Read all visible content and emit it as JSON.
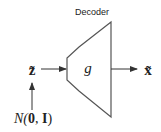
{
  "diagram": {
    "title": "Decoder",
    "block_label": "g",
    "input_label": "z̃",
    "output_label": "x̃",
    "prior_label": {
      "prefix": "N(",
      "zero": "0",
      "sep": ", ",
      "identity": "I",
      "suffix": ")"
    },
    "colors": {
      "stroke": "#444444",
      "text": "#222222",
      "background": "#ffffff"
    }
  }
}
